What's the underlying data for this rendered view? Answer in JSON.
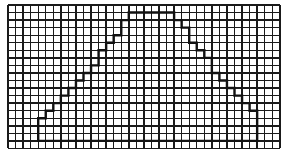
{
  "figure": {
    "type": "grid-shape",
    "grid": {
      "origin_x": 8,
      "origin_y": 5,
      "cell_size": 7.55,
      "columns": 36,
      "rows": 19,
      "line_color": "#1a1a1a"
    },
    "shape": {
      "stroke_color": "#111111",
      "points_grid_units": [
        [
          4,
          18
        ],
        [
          4,
          15
        ],
        [
          5,
          15
        ],
        [
          5,
          14
        ],
        [
          6,
          14
        ],
        [
          6,
          13
        ],
        [
          7,
          13
        ],
        [
          7,
          12
        ],
        [
          8,
          12
        ],
        [
          8,
          11
        ],
        [
          9,
          11
        ],
        [
          9,
          10
        ],
        [
          10,
          10
        ],
        [
          10,
          9
        ],
        [
          11,
          9
        ],
        [
          11,
          8
        ],
        [
          12,
          8
        ],
        [
          12,
          6
        ],
        [
          13,
          6
        ],
        [
          13,
          5
        ],
        [
          14,
          5
        ],
        [
          14,
          4
        ],
        [
          15,
          4
        ],
        [
          15,
          2
        ],
        [
          16,
          2
        ],
        [
          16,
          1
        ],
        [
          22,
          1
        ],
        [
          22,
          2
        ],
        [
          23,
          2
        ],
        [
          23,
          3
        ],
        [
          24,
          3
        ],
        [
          24,
          5
        ],
        [
          25,
          5
        ],
        [
          25,
          6
        ],
        [
          26,
          6
        ],
        [
          26,
          7
        ],
        [
          27,
          7
        ],
        [
          27,
          9
        ],
        [
          28,
          9
        ],
        [
          28,
          10
        ],
        [
          29,
          10
        ],
        [
          29,
          11
        ],
        [
          30,
          11
        ],
        [
          30,
          12
        ],
        [
          31,
          12
        ],
        [
          31,
          13
        ],
        [
          32,
          13
        ],
        [
          32,
          14
        ],
        [
          33,
          14
        ],
        [
          33,
          18
        ]
      ]
    }
  }
}
